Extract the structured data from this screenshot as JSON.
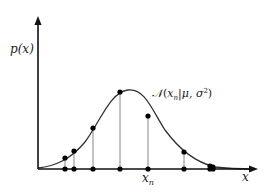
{
  "chart_data": {
    "type": "line",
    "title": "",
    "xlabel": "x",
    "ylabel": "p(x)",
    "curve_label": "N(x_n|μ,σ²)",
    "curve_label_display": {
      "N": "𝒩",
      "open": "(",
      "x": "x",
      "sub": "n",
      "mid": "|μ, σ",
      "sup": "2",
      "close": ")"
    },
    "highlighted_point_label": {
      "base": "x",
      "sub": "n"
    },
    "samples": [
      {
        "px": 65,
        "py": 158
      },
      {
        "px": 74,
        "py": 151
      },
      {
        "px": 93,
        "py": 128
      },
      {
        "px": 120,
        "py": 92
      },
      {
        "px": 148,
        "py": 116,
        "label": "x_n"
      },
      {
        "px": 184,
        "py": 152
      },
      {
        "px": 210,
        "py": 166
      },
      {
        "px": 213,
        "py": 167
      }
    ],
    "axis": {
      "origin": [
        38,
        169
      ],
      "x_end": 258,
      "y_end": 17
    },
    "grid": false,
    "legend": null
  },
  "colors": {
    "axis": "#111111",
    "curve": "#333333",
    "stem": "#888888",
    "dot": "#000000"
  }
}
